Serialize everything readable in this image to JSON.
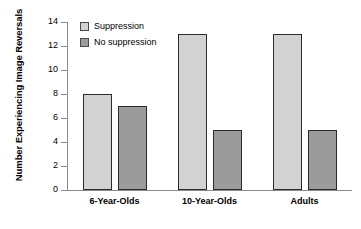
{
  "chart_data": {
    "type": "bar",
    "title": "",
    "subtitle": "",
    "xlabel": "",
    "ylabel": "Number Experiencing Image Reversals",
    "categories": [
      "6-Year-Olds",
      "10-Year-Olds",
      "Adults"
    ],
    "series": [
      {
        "name": "Suppression",
        "color": "#d2d2d2",
        "values": [
          8,
          13,
          13
        ]
      },
      {
        "name": "No suppression",
        "color": "#9b9b9b",
        "values": [
          7,
          5,
          5
        ]
      }
    ],
    "ylim": [
      0,
      14
    ],
    "yticks": [
      0,
      2,
      4,
      6,
      8,
      10,
      12,
      14
    ],
    "ytick_labels": [
      "0",
      "2",
      "4",
      "6",
      "8",
      "10",
      "12",
      "14"
    ],
    "grid": false,
    "legend_position": "top-left",
    "legend_entries": [
      "Suppression",
      "No suppression"
    ],
    "annotations": []
  },
  "colors": {
    "axis": "#8a8a8a",
    "bar_outline": "#2b2b2b",
    "text": "#000000",
    "background": "#ffffff"
  }
}
